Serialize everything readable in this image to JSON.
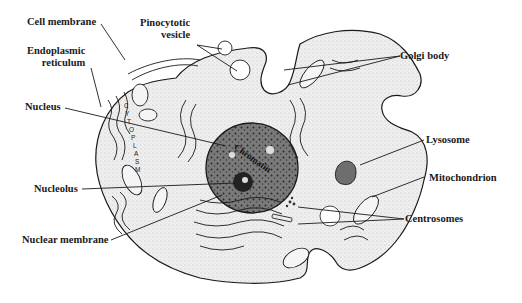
{
  "diagram": {
    "cytoplasm_text": "CYTOPLASM",
    "chromatin_text": "Chromatin",
    "labels": {
      "cell_membrane": "Cell membrane",
      "pinocytotic_vesicle_line1": "Pinocytotic",
      "pinocytotic_vesicle_line2": "vesicle",
      "endoplasmic_reticulum_line1": "Endoplasmic",
      "endoplasmic_reticulum_line2": "reticulum",
      "golgi_body": "Golgi body",
      "nucleus": "Nucleus",
      "lysosome": "Lysosome",
      "nucleolus": "Nucleolus",
      "mitochondrion": "Mitochondrion",
      "centrosomes": "Centrosomes",
      "nuclear_membrane": "Nuclear membrane"
    },
    "colors": {
      "ink": "#1a1a1a",
      "cytoplasm_fill": "#ececec",
      "nucleus_fill": "#8a8a8a",
      "background": "#ffffff"
    }
  }
}
